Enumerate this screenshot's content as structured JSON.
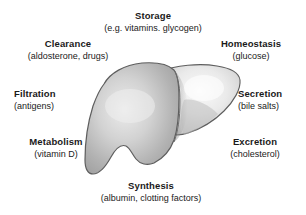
{
  "diagram": {
    "figure_name": "liver-illustration",
    "colors": {
      "background": "#ffffff",
      "text": "#1a1a1a",
      "outline": "#5a5a5a",
      "left_lobe_fill": "#b4b4b4",
      "left_lobe_highlight": "#e8e8e8",
      "right_lobe_fill": "#d8d8d8",
      "right_lobe_highlight": "#f4f4f4",
      "lobe_shadow": "#9a9a9a"
    },
    "labels": [
      {
        "id": "storage",
        "title": "Storage",
        "sub": "(e.g. vitamins. glycogen)",
        "position": "top"
      },
      {
        "id": "clearance",
        "title": "Clearance",
        "sub": "(aldosterone, drugs)",
        "position": "top-left"
      },
      {
        "id": "homeostasis",
        "title": "Homeostasis",
        "sub": "(glucose)",
        "position": "top-right"
      },
      {
        "id": "filtration",
        "title": "Filtration",
        "sub": "(antigens)",
        "position": "left"
      },
      {
        "id": "secretion",
        "title": "Secretion",
        "sub": "(bile salts)",
        "position": "right"
      },
      {
        "id": "metabolism",
        "title": "Metabolism",
        "sub": "(vitamin D)",
        "position": "bottom-left"
      },
      {
        "id": "excretion",
        "title": "Excretion",
        "sub": "(cholesterol)",
        "position": "bottom-right"
      },
      {
        "id": "synthesis",
        "title": "Synthesis",
        "sub": "(albumin, clotting factors)",
        "position": "bottom"
      }
    ]
  }
}
